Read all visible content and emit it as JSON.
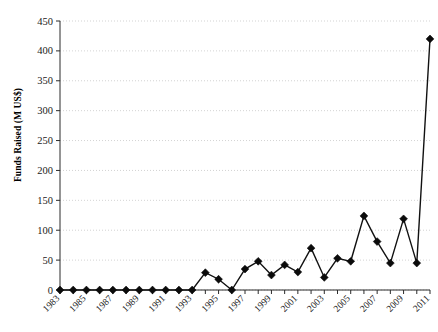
{
  "chart_data": {
    "type": "line",
    "title": "",
    "subtitle": "",
    "xlabel": "",
    "ylabel": "Funds Raised (M US$)",
    "ylim": [
      0,
      450
    ],
    "ytick_step": 50,
    "yticks": [
      0,
      50,
      100,
      150,
      200,
      250,
      300,
      350,
      400,
      450
    ],
    "ytick_labels": [
      "0",
      "50",
      "100",
      "150",
      "200",
      "250",
      "300",
      "350",
      "400",
      "450"
    ],
    "grid": true,
    "grid_axis": "y",
    "grid_style": "dotted",
    "legend": false,
    "legend_position": "none",
    "marker": "diamond",
    "x": [
      1983,
      1984,
      1985,
      1986,
      1987,
      1988,
      1989,
      1990,
      1991,
      1992,
      1993,
      1994,
      1995,
      1996,
      1997,
      1998,
      1999,
      2000,
      2001,
      2002,
      2003,
      2004,
      2005,
      2006,
      2007,
      2008,
      2009,
      2010,
      2011
    ],
    "xtick_labels": [
      "1983",
      "",
      "1985",
      "",
      "1987",
      "",
      "1989",
      "",
      "1991",
      "",
      "1993",
      "",
      "1995",
      "",
      "1997",
      "",
      "1999",
      "",
      "2001",
      "",
      "2003",
      "",
      "2005",
      "",
      "2007",
      "",
      "2009",
      "",
      "2011"
    ],
    "xtick_labels_shown": [
      "1983",
      "1985",
      "1987",
      "1989",
      "1991",
      "1993",
      "1995",
      "1997",
      "1999",
      "2001",
      "2003",
      "2005",
      "2007",
      "2009",
      "2011"
    ],
    "values": [
      0,
      0,
      0,
      0,
      0,
      0,
      0,
      0,
      0,
      0,
      0,
      29,
      18,
      0,
      35,
      48,
      25,
      42,
      30,
      70,
      21,
      53,
      48,
      124,
      81,
      45,
      119,
      45,
      420
    ],
    "series": [
      {
        "name": "Funds Raised",
        "values": [
          0,
          0,
          0,
          0,
          0,
          0,
          0,
          0,
          0,
          0,
          0,
          29,
          18,
          0,
          35,
          48,
          25,
          42,
          30,
          70,
          21,
          53,
          48,
          124,
          81,
          45,
          119,
          45,
          420
        ]
      }
    ],
    "colors": {
      "line": "#111111",
      "marker": "#0b0b0b",
      "grid": "#c8c8c8",
      "axis": "#2b2b2b",
      "background": "#ffffff"
    }
  }
}
